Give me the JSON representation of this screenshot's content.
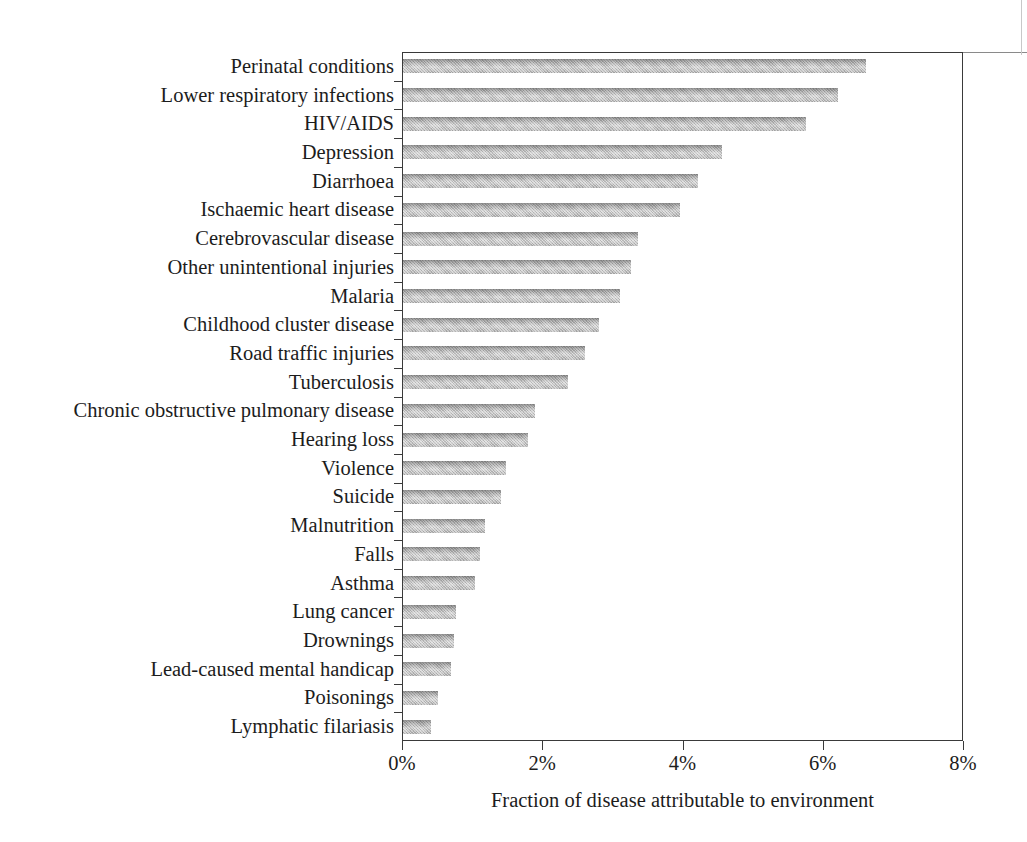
{
  "chart_data": {
    "type": "bar",
    "orientation": "horizontal",
    "title": "",
    "subtitle": "",
    "xlabel": "Fraction of disease attributable to environment",
    "ylabel": "",
    "xlim": [
      0,
      8
    ],
    "xticks": [
      0,
      2,
      4,
      6,
      8
    ],
    "xtick_labels": [
      "0%",
      "2%",
      "4%",
      "6%",
      "8%"
    ],
    "grid": false,
    "legend": null,
    "value_unit": "%",
    "bar_color": "#b4b4b4",
    "frame_color": "#3a3a3a",
    "categories": [
      "Perinatal conditions",
      "Lower respiratory infections",
      "HIV/AIDS",
      "Depression",
      "Diarrhoea",
      "Ischaemic heart disease",
      "Cerebrovascular disease",
      "Other unintentional injuries",
      "Malaria",
      "Childhood cluster disease",
      "Road traffic injuries",
      "Tuberculosis",
      "Chronic obstructive pulmonary disease",
      "Hearing loss",
      "Violence",
      "Suicide",
      "Malnutrition",
      "Falls",
      "Asthma",
      "Lung cancer",
      "Drownings",
      "Lead-caused mental handicap",
      "Poisonings",
      "Lymphatic filariasis"
    ],
    "values": [
      6.6,
      6.2,
      5.75,
      4.55,
      4.2,
      3.95,
      3.35,
      3.25,
      3.1,
      2.8,
      2.6,
      2.35,
      1.88,
      1.78,
      1.47,
      1.4,
      1.17,
      1.1,
      1.03,
      0.76,
      0.73,
      0.68,
      0.5,
      0.4
    ]
  }
}
